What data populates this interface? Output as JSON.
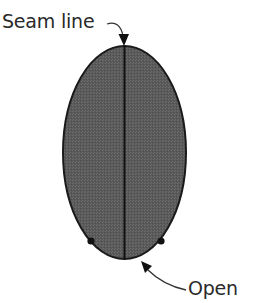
{
  "diagram": {
    "labels": {
      "seam_line": "Seam line",
      "open": "Open"
    },
    "shape": {
      "type": "ellipse",
      "fill_color": "#5e5e5e",
      "stroke_color": "#1a1a1a",
      "center": [
        124.5,
        152.5
      ],
      "rx": 61.5,
      "ry": 106.5
    },
    "seam": {
      "x": 124.5,
      "y_top": 46,
      "y_bottom": 259
    },
    "markers": [
      {
        "name": "left-dot",
        "x": 91,
        "y": 241
      },
      {
        "name": "right-dot",
        "x": 161,
        "y": 241
      }
    ],
    "arrows": [
      {
        "name": "seam-line-arrow",
        "points_to": "top-of-seam"
      },
      {
        "name": "open-arrow",
        "points_to": "bottom-opening"
      }
    ]
  }
}
